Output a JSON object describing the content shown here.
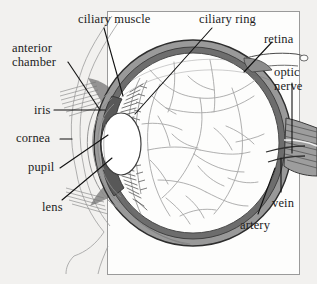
{
  "diagram": {
    "frame": {
      "x": 107,
      "y": 11,
      "width": 193,
      "height": 264
    },
    "palette": {
      "background": "#f2f1ef",
      "frame_line": "#8e8e8e",
      "ink": "#1c1c1c",
      "sclera_grey": "#8d8d8d",
      "sclera_dark": "#4a4a4a",
      "choroid_grey": "#777777",
      "vitreous": "#fdfdfc",
      "vessel_grey": "#9a9a9a",
      "lens_fill": "#ffffff",
      "iris_dark": "#555555",
      "leader_line": "#111111"
    },
    "labels": [
      {
        "id": "ciliary-muscle",
        "text": "ciliary muscle",
        "x": 78,
        "y": 13,
        "lines": [
          "ciliary muscle"
        ]
      },
      {
        "id": "ciliary-ring",
        "text": "ciliary ring",
        "x": 199,
        "y": 13,
        "lines": [
          "ciliary ring"
        ]
      },
      {
        "id": "retina",
        "text": "retina",
        "x": 264,
        "y": 33,
        "lines": [
          "retina"
        ]
      },
      {
        "id": "anterior-chamber",
        "text": "anterior chamber",
        "x": 12,
        "y": 42,
        "lines": [
          "anterior",
          "chamber"
        ]
      },
      {
        "id": "optic-nerve",
        "text": "optic nerve",
        "x": 274,
        "y": 66,
        "lines": [
          "optic",
          "nerve"
        ]
      },
      {
        "id": "iris",
        "text": "iris",
        "x": 34,
        "y": 106,
        "lines": [
          "iris"
        ]
      },
      {
        "id": "cornea",
        "text": "cornea",
        "x": 16,
        "y": 134,
        "lines": [
          "cornea"
        ]
      },
      {
        "id": "pupil",
        "text": "pupil",
        "x": 28,
        "y": 162,
        "lines": [
          "pupil"
        ]
      },
      {
        "id": "lens",
        "text": "lens",
        "x": 42,
        "y": 202,
        "lines": [
          "lens"
        ]
      },
      {
        "id": "vein",
        "text": "vein",
        "x": 272,
        "y": 198,
        "lines": [
          "vein"
        ]
      },
      {
        "id": "artery",
        "text": "artery",
        "x": 240,
        "y": 220,
        "lines": [
          "artery"
        ]
      }
    ],
    "leaders": [
      {
        "id": "ciliary-muscle-leader",
        "from": [
          104,
          28
        ],
        "to": [
          123,
          96
        ]
      },
      {
        "id": "ciliary-ring-leader",
        "from": [
          212,
          28
        ],
        "to": [
          135,
          114
        ]
      },
      {
        "id": "retina-leader",
        "from": [
          272,
          42
        ],
        "to": [
          244,
          72
        ]
      },
      {
        "id": "anterior-chamber-leader",
        "from": [
          68,
          62
        ],
        "to": [
          100,
          110
        ]
      },
      {
        "id": "optic-nerve-leader",
        "from": [
          292,
          83
        ],
        "to": [
          292,
          153
        ]
      },
      {
        "id": "iris-leader",
        "from": [
          54,
          110
        ],
        "to": [
          105,
          110
        ]
      },
      {
        "id": "cornea-leader",
        "from": [
          60,
          139
        ],
        "to": [
          72,
          139
        ]
      },
      {
        "id": "pupil-leader",
        "from": [
          60,
          168
        ],
        "to": [
          108,
          135
        ]
      },
      {
        "id": "lens-leader",
        "from": [
          62,
          200
        ],
        "to": [
          112,
          158
        ]
      },
      {
        "id": "vein-leader",
        "from": [
          281,
          192
        ],
        "to": [
          281,
          158
        ]
      },
      {
        "id": "artery-leader",
        "from": [
          258,
          214
        ],
        "to": [
          275,
          168
        ]
      }
    ],
    "structures": [
      {
        "id": "sclera",
        "name": "sclera",
        "description": "outer grey fibrous coat forming the globe wall"
      },
      {
        "id": "choroid",
        "name": "choroid",
        "description": "dark vascular layer inside the sclera"
      },
      {
        "id": "retina",
        "name": "retina",
        "description": "innermost light sensitive layer"
      },
      {
        "id": "vitreous-body",
        "name": "vitreous body",
        "description": "clear interior filled with branching vessel tracery"
      },
      {
        "id": "lens",
        "name": "lens",
        "description": "white biconvex oval behind the pupil"
      },
      {
        "id": "iris",
        "name": "iris",
        "description": "dark band bounding the pupil"
      },
      {
        "id": "pupil",
        "name": "pupil",
        "description": "central aperture of the iris"
      },
      {
        "id": "cornea",
        "name": "cornea",
        "description": "transparent anterior arcs in front of the iris"
      },
      {
        "id": "anterior-chamber",
        "name": "anterior chamber",
        "description": "space between cornea and iris"
      },
      {
        "id": "ciliary-processes",
        "name": "ciliary processes",
        "description": "radiating fringe around the lens"
      },
      {
        "id": "ciliary-ring",
        "name": "ciliary ring",
        "description": "scalloped band peripheral to the processes"
      },
      {
        "id": "optic-nerve",
        "name": "optic nerve",
        "description": "hatched band leaving the globe posteriorly"
      },
      {
        "id": "central-vein",
        "name": "vein",
        "description": "vessel within the optic nerve"
      },
      {
        "id": "central-artery",
        "name": "artery",
        "description": "vessel within the optic nerve"
      },
      {
        "id": "orbital-tissue",
        "name": "orbital tissue",
        "description": "faint hatching at upper and lower left"
      }
    ]
  }
}
